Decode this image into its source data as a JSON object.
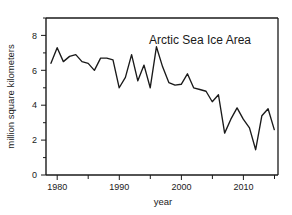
{
  "figure": {
    "width": 292,
    "height": 215,
    "background_color": "#ffffff",
    "line_color": "#1a1a1a",
    "axis_color": "#1a1a1a"
  },
  "chart_data": {
    "type": "line",
    "title": "Arctic Sea Ice Area",
    "xlabel": "year",
    "ylabel": "million square kilometers",
    "xlim": [
      1978.2,
      2015.6
    ],
    "ylim": [
      0,
      9
    ],
    "grid": false,
    "legend": null,
    "xticks_major": [
      "1980",
      "1990",
      "2000",
      "2010"
    ],
    "xticks_major_values": [
      1980,
      1990,
      2000,
      2010
    ],
    "xticks_minor_values": [
      1985,
      1995,
      2005,
      2015
    ],
    "yticks_major": [
      "0",
      "2",
      "4",
      "6",
      "8"
    ],
    "yticks_major_values": [
      0,
      2,
      4,
      6,
      8
    ],
    "yticks_minor_values": [
      1,
      3,
      5,
      7,
      9
    ],
    "x": [
      1979,
      1980,
      1981,
      1982,
      1983,
      1984,
      1985,
      1986,
      1987,
      1988,
      1989,
      1990,
      1991,
      1992,
      1993,
      1994,
      1995,
      1996,
      1997,
      1998,
      1999,
      2000,
      2001,
      2002,
      2003,
      2004,
      2005,
      2006,
      2007,
      2008,
      2009,
      2010,
      2011,
      2012,
      2013,
      2014,
      2015
    ],
    "values": [
      6.4,
      7.3,
      6.5,
      6.8,
      6.9,
      6.5,
      6.4,
      6.0,
      6.7,
      6.7,
      6.6,
      5.0,
      5.6,
      6.9,
      5.4,
      6.3,
      5.0,
      7.35,
      6.2,
      5.3,
      5.15,
      5.2,
      5.8,
      5.0,
      4.9,
      4.8,
      4.2,
      4.6,
      2.4,
      3.2,
      3.85,
      3.2,
      2.7,
      1.45,
      3.4,
      3.8,
      2.6
    ],
    "series": [
      {
        "name": "Arctic Sea Ice Area",
        "values": [
          6.4,
          7.3,
          6.5,
          6.8,
          6.9,
          6.5,
          6.4,
          6.0,
          6.7,
          6.7,
          6.6,
          5.0,
          5.6,
          6.9,
          5.4,
          6.3,
          5.0,
          7.35,
          6.2,
          5.3,
          5.15,
          5.2,
          5.8,
          5.0,
          4.9,
          4.8,
          4.2,
          4.6,
          2.4,
          3.2,
          3.85,
          3.2,
          2.7,
          1.45,
          3.4,
          3.8,
          2.6
        ]
      }
    ],
    "annotations": [
      {
        "label": "maximum",
        "x": 1996,
        "y": 7.35
      },
      {
        "label": "minimum",
        "x": 2012,
        "y": 1.45
      }
    ]
  }
}
